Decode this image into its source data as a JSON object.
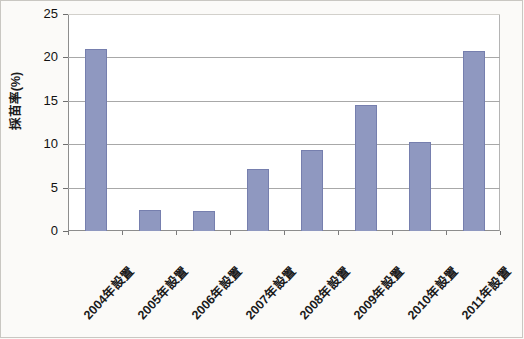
{
  "chart_data": {
    "type": "bar",
    "title": "",
    "xlabel": "",
    "ylabel": "採苗率(%)",
    "categories": [
      "2004年設置",
      "2005年設置",
      "2006年設置",
      "2007年設置",
      "2008年設置",
      "2009年設置",
      "2010年設置",
      "2011年設置"
    ],
    "values": [
      21.0,
      2.4,
      2.3,
      7.2,
      9.3,
      14.5,
      10.3,
      20.7
    ],
    "ylim": [
      0,
      25
    ],
    "yticks": [
      0,
      5,
      10,
      15,
      20,
      25
    ],
    "ytick_labels": [
      "0",
      "5",
      "10",
      "15",
      "20",
      "25"
    ],
    "grid": true,
    "legend": "none",
    "series_color": "#8f98c0",
    "series_border_color": "#767fae",
    "gridline_color": "#a8a8a8",
    "axis_color": "#8d8d8d",
    "background_color": "#fbfaf8",
    "plot_background_color": "#ffffff"
  }
}
